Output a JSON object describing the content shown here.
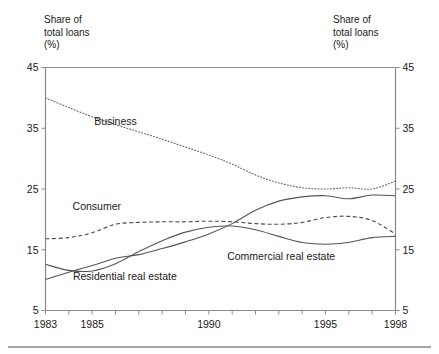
{
  "chart_data": {
    "type": "line",
    "title": "",
    "subtitle": "",
    "xlabel": "",
    "ylabel": "Share of total loans (%)",
    "ylabel_left": "Share of\ntotal loans\n(%)",
    "ylabel_right": "Share of\ntotal loans\n(%)",
    "grid": false,
    "legend_position": "inline-annotations",
    "xlim": [
      1983,
      1998
    ],
    "ylim": [
      5,
      45
    ],
    "yticks": [
      5,
      15,
      25,
      35,
      45
    ],
    "ytick_labels": [
      "5",
      "15",
      "25",
      "35",
      "45"
    ],
    "xticks": [
      1983,
      1984,
      1985,
      1986,
      1987,
      1988,
      1989,
      1990,
      1991,
      1992,
      1993,
      1994,
      1995,
      1996,
      1997,
      1998
    ],
    "xtick_labels_shown": [
      "1983",
      "1985",
      "1990",
      "1995",
      "1998"
    ],
    "x": [
      1983,
      1984,
      1985,
      1986,
      1987,
      1988,
      1989,
      1990,
      1991,
      1992,
      1993,
      1994,
      1995,
      1996,
      1997,
      1998
    ],
    "series": [
      {
        "name": "Business",
        "style": "dotted",
        "color": "#666666",
        "label_x": 1986.0,
        "label_y": 35.6,
        "values": [
          40.0,
          38.4,
          36.9,
          35.6,
          34.4,
          33.2,
          31.9,
          30.6,
          29.1,
          27.3,
          26.0,
          25.2,
          25.0,
          25.2,
          25.0,
          26.3
        ]
      },
      {
        "name": "Consumer",
        "style": "dashed",
        "color": "#4a4a4a",
        "label_x": 1985.2,
        "label_y": 21.6,
        "values": [
          16.8,
          17.0,
          17.8,
          19.2,
          19.5,
          19.6,
          19.6,
          19.7,
          19.6,
          19.3,
          19.2,
          19.5,
          20.3,
          20.5,
          19.8,
          17.6
        ]
      },
      {
        "name": "Residential real estate",
        "style": "solid",
        "color": "#555555",
        "label_x": 1986.4,
        "label_y": 10.0,
        "values": [
          10.1,
          11.3,
          12.4,
          13.6,
          14.2,
          15.2,
          16.3,
          17.6,
          19.3,
          21.5,
          23.0,
          23.7,
          23.9,
          23.4,
          24.0,
          23.9
        ]
      },
      {
        "name": "Commercial real estate",
        "style": "solid",
        "color": "#555555",
        "label_x": 1993.1,
        "label_y": 13.3,
        "values": [
          12.6,
          11.6,
          11.5,
          12.7,
          14.7,
          16.5,
          17.9,
          18.7,
          18.9,
          18.3,
          17.2,
          16.2,
          15.9,
          16.2,
          17.0,
          17.2
        ]
      }
    ]
  },
  "axis": {
    "left_title": "Share of\ntotal loans\n(%)",
    "right_title": "Share of\ntotal loans\n(%)"
  }
}
